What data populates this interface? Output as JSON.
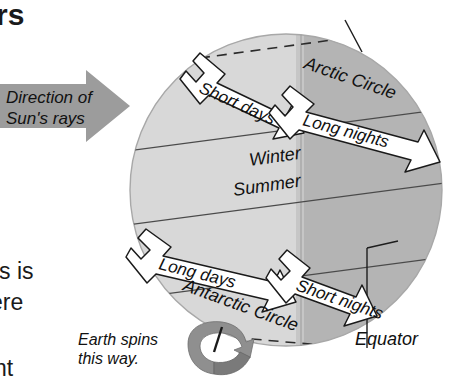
{
  "figure": {
    "type": "diagram",
    "background_color": "#ffffff"
  },
  "cropped_text": {
    "top_left_fragment": "rs",
    "left_fragment_1": "is is",
    "left_fragment_2": "ere",
    "left_fragment_3": "nt"
  },
  "sun_arrow": {
    "line1": "Direction of",
    "line2": "Sun's rays",
    "color": "#9a9a9a"
  },
  "spin_note": {
    "line1": "Earth spins",
    "line2": "this way."
  },
  "globe": {
    "center_x": 286,
    "center_y": 190,
    "radius": 156,
    "lit_color": "#d6d6d6",
    "dark_color": "#b3b3b3",
    "outline_color": "#9c9c9c",
    "terminator_x": 301
  },
  "latitude_labels": {
    "arctic_circle": "Arctic Circle",
    "antarctic_circle": "Antarctic Circle",
    "equator": "Equator"
  },
  "season_labels": {
    "northern": "Winter",
    "southern": "Summer"
  },
  "daynight_arrows": [
    {
      "label": "Short days",
      "region": "northern-lit"
    },
    {
      "label": "Long nights",
      "region": "northern-dark"
    },
    {
      "label": "Long days",
      "region": "southern-lit"
    },
    {
      "label": "Short nights",
      "region": "southern-dark"
    }
  ],
  "colors": {
    "ink": "#111111",
    "arrow_fill": "#ffffff",
    "arrow_stroke": "#1a1a1a",
    "gray_arrow": "#9a9a9a",
    "gray_arrow_dark": "#7d7d7d"
  }
}
